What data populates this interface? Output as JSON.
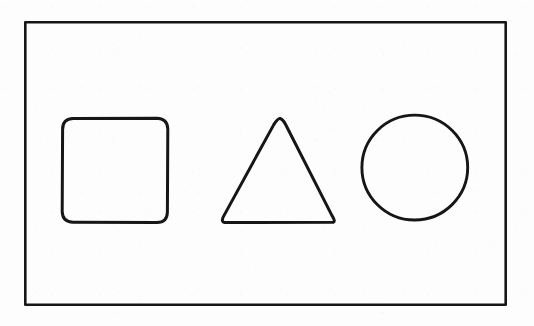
{
  "document": {
    "title": "Geometric shapes line drawing",
    "kind": "scanned-line-drawing",
    "background_color": "#fdfdfd",
    "ink_color": "#161616",
    "canvas": {
      "width": 534,
      "height": 326
    }
  },
  "frame": {
    "name": "outer border rectangle",
    "shape": "rectangle",
    "x": 24,
    "y": 21,
    "width": 483,
    "height": 285,
    "stroke_width": 2.6,
    "fill": "none"
  },
  "shapes": [
    {
      "id": "square",
      "label": "Rounded square",
      "shape": "rounded-rectangle",
      "x": 62,
      "y": 118,
      "width": 106,
      "height": 105,
      "corner_radius": 11,
      "stroke_width": 3.0,
      "fill": "none",
      "path": "M 73 118.5 L 157 118.2 Q 167.5 118.6 167.8 129 L 167.4 212 Q 167.2 222.4 157 222.6 L 73 222.2 Q 62.4 222 62.2 211.5 L 62.6 129.5 Q 62.4 119 73 118.5 Z"
    },
    {
      "id": "triangle",
      "label": "Equilateral-style triangle",
      "shape": "triangle",
      "apex": [
        280,
        118
      ],
      "base_left": [
        222,
        222
      ],
      "base_right": [
        335,
        222
      ],
      "width": 113,
      "height": 104,
      "stroke_width": 3.0,
      "fill": "none",
      "path": "M 280 118.4 Q 283 119.4 285.5 124.2 L 332 215.6 Q 335.6 221 333.4 222.3 L 224.5 222.5 Q 220.9 221.7 223.4 216.6 L 273.8 124.6 Q 277 119.3 280 118.4 Z"
    },
    {
      "id": "circle",
      "label": "Circle",
      "shape": "circle",
      "center_x": 414.7,
      "center_y": 167.5,
      "radius_x": 53,
      "radius_y": 52.5,
      "diameter": 105,
      "stroke_width": 2.9,
      "fill": "none"
    }
  ],
  "counts": {
    "shape_count": 3,
    "shape_names": [
      "square",
      "triangle",
      "circle"
    ]
  }
}
